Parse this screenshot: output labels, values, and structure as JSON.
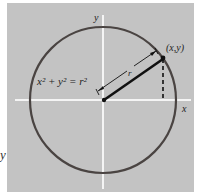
{
  "figure": {
    "background_color": "#c3c3c3",
    "axis_color": "#f4f4f4",
    "circle_color": "#4a4442",
    "line_color": "#111111",
    "equation_label": "x² + y² = r²",
    "point_label": "(x,y)",
    "radius_label": "r",
    "x_axis_label": "x",
    "y_axis_label": "y"
  },
  "stray_text": "y"
}
